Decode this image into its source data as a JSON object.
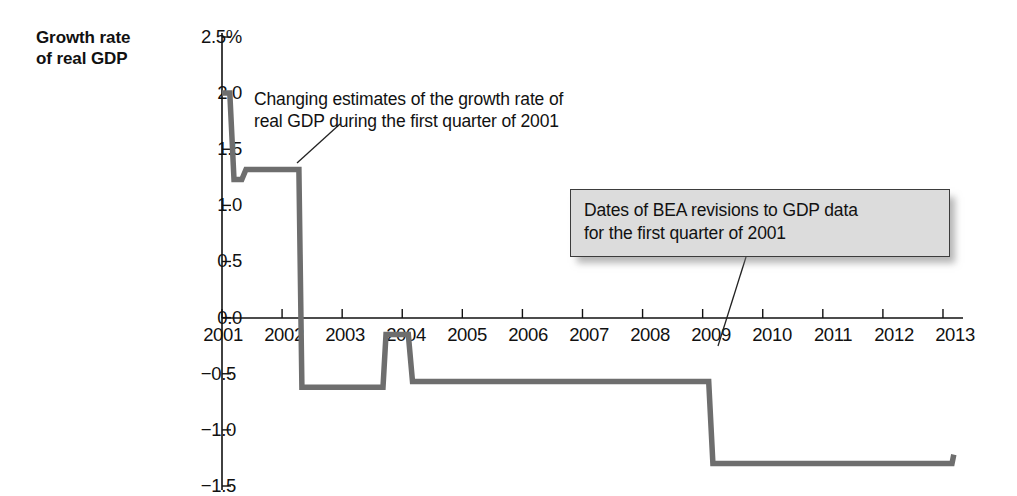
{
  "figure": {
    "axis_title": "Growth rate\nof real GDP",
    "annotations": [
      {
        "name": "changing-estimates-callout",
        "text": "Changing estimates of the growth rate of\nreal GDP during the first quarter of 2001",
        "boxed": false
      },
      {
        "name": "bea-revisions-callout",
        "text": "Dates of BEA revisions to GDP data\nfor the first quarter of 2001",
        "boxed": true
      }
    ],
    "colors": {
      "line": "#6e6e6e",
      "axis": "#111111",
      "box_fill": "#dcdcdc",
      "box_border": "#3c3c3c",
      "text": "#111111"
    }
  },
  "chart_data": {
    "type": "line",
    "title": "",
    "subtitle": "",
    "xlabel": "",
    "ylabel": "Growth rate of real GDP",
    "xlim": [
      2001,
      2013.2
    ],
    "ylim": [
      -1.5,
      2.5
    ],
    "grid": false,
    "legend": null,
    "y_tick_labels": [
      "2.5%",
      "2.0",
      "1.5",
      "1.0",
      "0.5",
      "0.0",
      "−0.5",
      "−1.0",
      "−1.5"
    ],
    "y_ticks": [
      2.5,
      2.0,
      1.5,
      1.0,
      0.5,
      0.0,
      -0.5,
      -1.0,
      -1.5
    ],
    "x_tick_labels": [
      "2001",
      "2002",
      "2003",
      "2004",
      "2005",
      "2006",
      "2007",
      "2008",
      "2009",
      "2010",
      "2011",
      "2012",
      "2013"
    ],
    "x_ticks": [
      2001,
      2002,
      2003,
      2004,
      2005,
      2006,
      2007,
      2008,
      2009,
      2010,
      2011,
      2012,
      2013
    ],
    "series": [
      {
        "name": "Estimate of 2001Q1 real GDP growth rate",
        "step": true,
        "points": [
          [
            2001.0,
            2.0
          ],
          [
            2001.13,
            2.0
          ],
          [
            2001.2,
            1.23
          ],
          [
            2001.33,
            1.23
          ],
          [
            2001.4,
            1.32
          ],
          [
            2002.28,
            1.32
          ],
          [
            2002.33,
            -0.62
          ],
          [
            2003.68,
            -0.62
          ],
          [
            2003.73,
            -0.15
          ],
          [
            2004.1,
            -0.15
          ],
          [
            2004.17,
            -0.57
          ],
          [
            2009.1,
            -0.57
          ],
          [
            2009.17,
            -1.3
          ],
          [
            2013.15,
            -1.3
          ],
          [
            2013.18,
            -1.22
          ]
        ]
      }
    ],
    "annotation_values": {
      "initial_estimate": 2.0,
      "second_estimate": 1.23,
      "third_estimate": 1.32,
      "2002_revision": -0.62,
      "2003_revision": -0.15,
      "2004_revision": -0.57,
      "2009_revision": -1.3
    }
  }
}
